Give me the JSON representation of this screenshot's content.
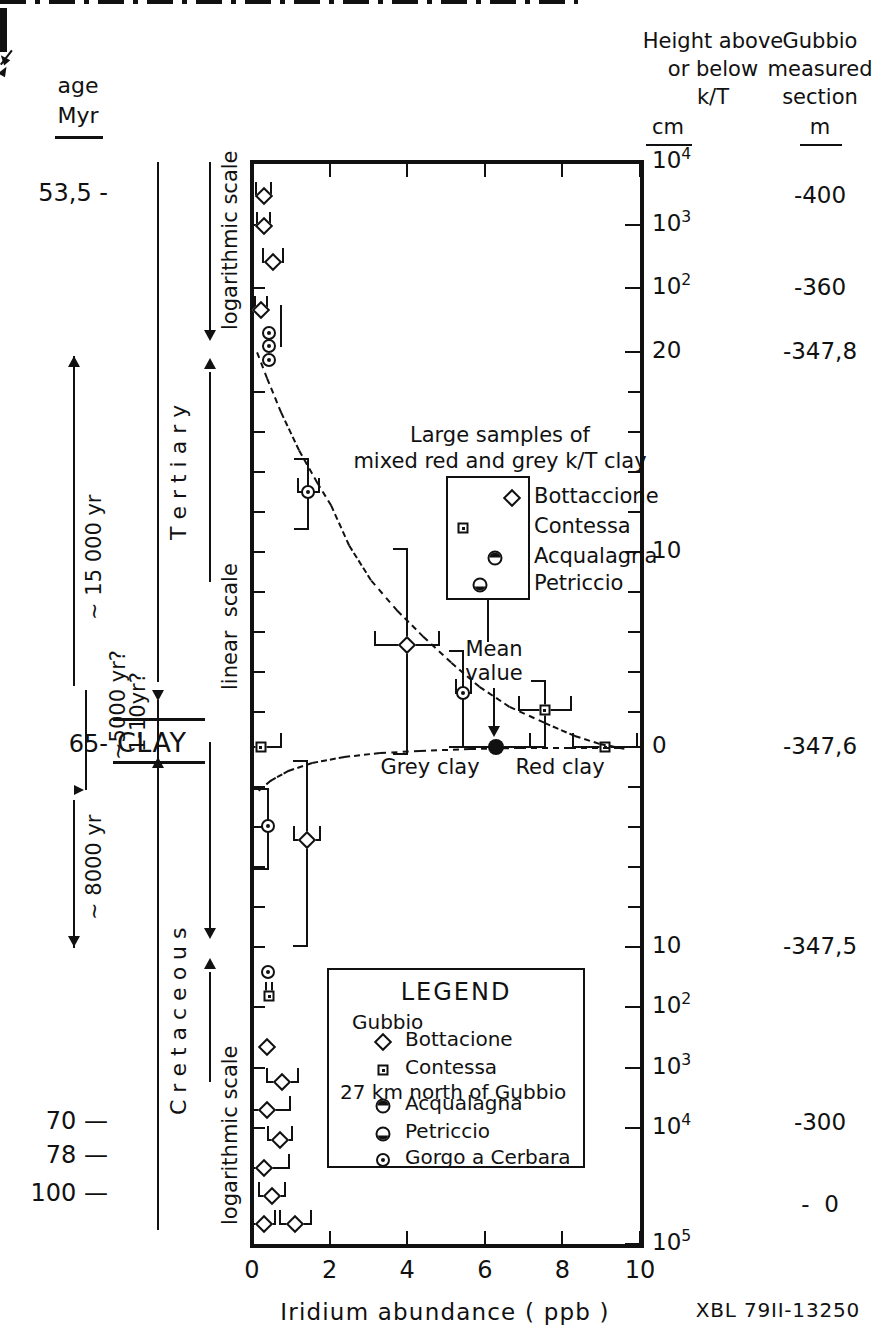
{
  "figure": {
    "credit": "XBL 79II-13250",
    "xaxis": {
      "label": "Iridium abundance ( ppb )",
      "ticks": [
        "0",
        "2",
        "4",
        "6",
        "8",
        "10"
      ],
      "range": [
        0,
        10
      ]
    },
    "left_headers": {
      "line1": "age",
      "line2": "Myr"
    },
    "right_headers": {
      "height": {
        "line1": "Height above",
        "line2": "or below",
        "line3": "k/T",
        "unit": "cm"
      },
      "section": {
        "line1": "Gubbio",
        "line2": "measured",
        "line3": "section",
        "unit": "m"
      }
    }
  },
  "age_ticks": [
    {
      "label": "53,5 -"
    },
    {
      "label": "65-"
    },
    {
      "label": "70 —"
    },
    {
      "label": "78 —"
    },
    {
      "label": "100 —"
    }
  ],
  "periods": [
    {
      "name": "T e r t i a r y"
    },
    {
      "name": "C r e t a c e o u s"
    },
    {
      "name": "CLAY"
    }
  ],
  "scale_labels": [
    {
      "text": "logarithmic scale"
    },
    {
      "text": "linear  scale"
    },
    {
      "text": "logarithmic scale"
    }
  ],
  "duration_labels": [
    {
      "text": "~ 15 000 yr"
    },
    {
      "text": "~5000 yr?"
    },
    {
      "text": "1-10yr?"
    },
    {
      "text": "~ 8000 yr"
    }
  ],
  "height_axis": {
    "unit": "cm",
    "ticks": [
      {
        "label": "10⁴",
        "sup": "4",
        "base": "10"
      },
      {
        "label": "10³",
        "sup": "3",
        "base": "10"
      },
      {
        "label": "10²",
        "sup": "2",
        "base": "10"
      },
      {
        "label": "20",
        "sup": "",
        "base": "20"
      },
      {
        "label": "10",
        "sup": "",
        "base": "10"
      },
      {
        "label": "0",
        "sup": "",
        "base": "0"
      },
      {
        "label": "10",
        "sup": "",
        "base": "10"
      },
      {
        "label": "10²",
        "sup": "2",
        "base": "10"
      },
      {
        "label": "10³",
        "sup": "3",
        "base": "10"
      },
      {
        "label": "10⁴",
        "sup": "4",
        "base": "10"
      },
      {
        "label": "10⁵",
        "sup": "5",
        "base": "10"
      }
    ]
  },
  "section_axis": {
    "unit": "m",
    "ticks": [
      "-400",
      "-360",
      "-347,8",
      "-347,6",
      "-347,5",
      "-300",
      "-  0"
    ]
  },
  "inset": {
    "title_line1": "Large samples of",
    "title_line2": "mixed red and grey k/T clay",
    "entries": [
      {
        "label": "Bottaccione",
        "marker": "diamond"
      },
      {
        "label": "Contessa",
        "marker": "square-dot"
      },
      {
        "label": "Acqualagna",
        "marker": "circ-top"
      },
      {
        "label": "Petriccio",
        "marker": "circ-bot"
      }
    ]
  },
  "annotations": [
    {
      "name": "mean-value",
      "line1": "Mean",
      "line2": "value"
    },
    {
      "name": "grey-clay",
      "text": "Grey clay"
    },
    {
      "name": "red-clay",
      "text": "Red clay"
    }
  ],
  "legend": {
    "title": "LEGEND",
    "group1": "Gubbio",
    "group2": "27 km north of Gubbio",
    "items": [
      {
        "label": "Bottacione",
        "marker": "diamond",
        "group": 1
      },
      {
        "label": "Contessa",
        "marker": "square-dot",
        "group": 1
      },
      {
        "label": "Acqualagna",
        "marker": "circ-top",
        "group": 2
      },
      {
        "label": "Petriccio",
        "marker": "circ-bot",
        "group": 2
      },
      {
        "label": "Gorgo a Cerbara",
        "marker": "circ-dot",
        "group": 2
      }
    ]
  },
  "chart_data": {
    "type": "scatter",
    "xlabel": "Iridium abundance ( ppb )",
    "ylabel": "Height above or below k/T (cm)",
    "xlim": [
      0,
      10
    ],
    "xticks": [
      0,
      2,
      4,
      6,
      8,
      10
    ],
    "grid": false,
    "legend_position": "inside-bottom-center",
    "yaxis_note": "Piecewise: logarithmic above +20 cm, linear between +20 and -10 cm, logarithmic below -10 cm",
    "series": [
      {
        "name": "Bottacione",
        "marker": "diamond",
        "points": [
          {
            "x": 0.3,
            "y_cm": 5500,
            "xerr": 0.25
          },
          {
            "x": 0.32,
            "y_cm": 2600,
            "xerr": 0.22
          },
          {
            "x": 0.55,
            "y_cm": 1100,
            "xerr": 0.3
          },
          {
            "x": 0.22,
            "y_cm": 160,
            "xerr": 0.2
          },
          {
            "x": 4.0,
            "y_cm": 3.0,
            "xerr": 0.85,
            "yerr_cm": [
              1.5,
              7.0
            ]
          },
          {
            "x": 1.4,
            "y_cm": -3.5,
            "xerr": 0.4
          },
          {
            "x": 0.35,
            "y_cm": -60,
            "xerr": 0.22
          },
          {
            "x": 0.7,
            "y_cm": -340,
            "xerr": 0.45
          },
          {
            "x": 0.35,
            "y_cm": -900,
            "xerr": 0.55
          },
          {
            "x": 0.7,
            "y_cm": -2200,
            "xerr": 0.35
          },
          {
            "x": 0.25,
            "y_cm": -5500,
            "xerr": 0.7
          },
          {
            "x": 0.55,
            "y_cm": -14000,
            "xerr": 0.4
          },
          {
            "x": 0.35,
            "y_cm": -45000,
            "xerr": 0.35
          },
          {
            "x": 1.1,
            "y_cm": -45000,
            "xerr": 0.45
          }
        ]
      },
      {
        "name": "Contessa",
        "marker": "square-dot",
        "points": [
          {
            "x": 5.4,
            "y_cm": 1.6,
            "xerr": 1.2,
            "yerr_cm": [
              0.5,
              3.0
            ]
          },
          {
            "x": 7.9,
            "y_cm": 0.0,
            "xerr": 1.6
          },
          {
            "x": 0.2,
            "y_cm": 0.0,
            "xerr": 0.5
          },
          {
            "x": 0.4,
            "y_cm": -4500,
            "xerr": 0.1
          }
        ]
      },
      {
        "name": "Acqualagna",
        "marker": "circ-top",
        "points": []
      },
      {
        "name": "Petriccio",
        "marker": "circ-bot",
        "points": []
      },
      {
        "name": "Gorgo a Cerbara",
        "marker": "circ-dot",
        "points": [
          {
            "x": 0.45,
            "y_cm": 36
          },
          {
            "x": 0.45,
            "y_cm": 32
          },
          {
            "x": 0.45,
            "y_cm": 28
          },
          {
            "x": 1.45,
            "y_cm": 14.5,
            "xerr": 0.35,
            "yerr_cm": [
              13.0,
              16.5
            ]
          },
          {
            "x": 5.4,
            "y_cm": 0.8,
            "xerr": 0.3,
            "yerr_cm": [
              -1.2,
              3.0
            ]
          },
          {
            "x": 0.4,
            "y_cm": -2.8,
            "xerr": 0.22,
            "yerr_cm": [
              -1.2,
              -5.0
            ]
          },
          {
            "x": 0.4,
            "y_cm": -3000
          }
        ]
      },
      {
        "name": "Mean value",
        "marker": "circ-fill",
        "points": [
          {
            "x": 6.3,
            "y_cm": 0.0,
            "xerr": 0.9
          }
        ]
      }
    ],
    "annotations": [
      {
        "text": "Mean value",
        "x": 6.3,
        "y_cm": 0
      },
      {
        "text": "Grey clay",
        "x": 0.2,
        "y_cm": 0
      },
      {
        "text": "Red clay",
        "x": 7.9,
        "y_cm": 0
      },
      {
        "text": "Large samples of mixed red and grey k/T clay"
      }
    ],
    "trend": "dashed curve declining from ~20 cm above boundary through the clay peak and rising back below it"
  }
}
